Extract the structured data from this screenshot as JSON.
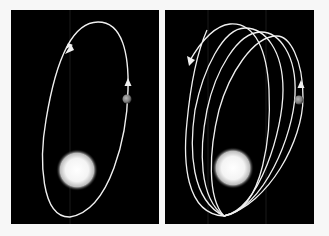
{
  "figure": {
    "background_color": "#f7f7f7",
    "panel_color": "#000000",
    "orbit_color": "#f2f2f2",
    "star_color": "#ffffff",
    "planet_color": "#8a8a8a"
  },
  "panels": [
    {
      "id": "left",
      "label": "Closed elliptical orbit",
      "orbit_count": 1,
      "arrows": [
        "down-left at upper-left of orbit",
        "up at right side of orbit"
      ]
    },
    {
      "id": "right",
      "label": "Precessing elliptical orbit",
      "orbit_count": 4,
      "arrows": [
        "down-left at outer-left orbit end",
        "up at right side of innermost orbit"
      ]
    }
  ]
}
